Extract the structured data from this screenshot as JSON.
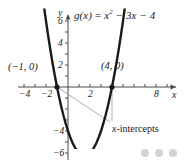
{
  "figure": {
    "title_parts": {
      "fn": "g",
      "arg": "(x)",
      "eq": " = ",
      "term1": "x",
      "exp1": "2",
      "term2": " − 3x − 4"
    },
    "x_axis_name": "x",
    "y_axis_name": "y"
  },
  "annotations": {
    "point_left": "(−1, 0)",
    "point_right": "(4, 0)",
    "intercepts_label_italic": "x",
    "intercepts_label_rest": "-intercepts"
  },
  "ticks": {
    "x": [
      {
        "value": -4,
        "label": "−4",
        "px": 24
      },
      {
        "value": -2,
        "label": "−2",
        "px": 46
      },
      {
        "value": 2,
        "label": "2",
        "px": 90
      },
      {
        "value": 8,
        "label": "8",
        "px": 156
      }
    ],
    "y": [
      {
        "value": 6,
        "label": "6",
        "py": 21
      },
      {
        "value": 4,
        "label": "4",
        "py": 43
      },
      {
        "value": 2,
        "label": "2",
        "py": 65
      },
      {
        "value": -4,
        "label": "−4",
        "py": 131
      },
      {
        "value": -6,
        "label": "−6",
        "py": 153
      }
    ]
  },
  "colors": {
    "curve": "#1a1a1a",
    "axis": "#4a4a4a",
    "leader": "#9a9a9a",
    "text": "#1a1a1a",
    "dots": "#d3d3d3",
    "background": "#ffffff"
  },
  "pager": {
    "dot_count": 3
  },
  "chart_data": {
    "type": "line",
    "xlabel": "x",
    "ylabel": "y",
    "xlim": [
      -4.8,
      9.8
    ],
    "ylim": [
      -7.1,
      7.3
    ],
    "grid": false,
    "legend": null,
    "function": "g(x) = x^2 - 3x - 4",
    "xticks": [
      -4,
      -2,
      2,
      8
    ],
    "yticks": [
      6,
      4,
      2,
      -4,
      -6
    ],
    "series": [
      {
        "name": "g(x) = x² − 3x − 4",
        "x": [
          -2.35,
          -2.2,
          -2.0,
          -1.8,
          -1.6,
          -1.4,
          -1.2,
          -1.0,
          -0.8,
          -0.6,
          -0.4,
          -0.2,
          0.0,
          0.2,
          0.4,
          0.6,
          0.8,
          1.0,
          1.2,
          1.4,
          1.5,
          1.6,
          1.8,
          2.0,
          2.2,
          2.4,
          2.6,
          2.8,
          3.0,
          3.2,
          3.4,
          3.6,
          3.8,
          4.0,
          4.2,
          4.4,
          4.6,
          4.8,
          5.0,
          5.2,
          5.35
        ],
        "y": [
          8.57,
          7.44,
          6.0,
          4.64,
          3.36,
          2.16,
          1.04,
          0.0,
          -0.96,
          -1.84,
          -2.64,
          -3.36,
          -4.0,
          -4.56,
          -5.04,
          -5.44,
          -5.76,
          -6.0,
          -6.16,
          -6.24,
          -6.25,
          -6.24,
          -6.16,
          -6.0,
          -5.76,
          -5.44,
          -5.04,
          -4.56,
          -4.0,
          -3.36,
          -2.64,
          -1.84,
          -0.96,
          0.0,
          1.04,
          2.16,
          3.36,
          4.64,
          6.0,
          7.44,
          8.57
        ]
      }
    ],
    "points": [
      {
        "label": "(−1, 0)",
        "x": -1,
        "y": 0,
        "marker": "filled-circle",
        "note": "x-intercept"
      },
      {
        "label": "(4, 0)",
        "x": 4,
        "y": 0,
        "marker": "filled-circle",
        "note": "x-intercept"
      }
    ],
    "vertex": {
      "x": 1.5,
      "y": -6.25
    },
    "annotations": [
      {
        "text": "x-intercepts",
        "points_to": [
          [
            -1,
            0
          ],
          [
            4,
            0
          ]
        ]
      }
    ]
  }
}
